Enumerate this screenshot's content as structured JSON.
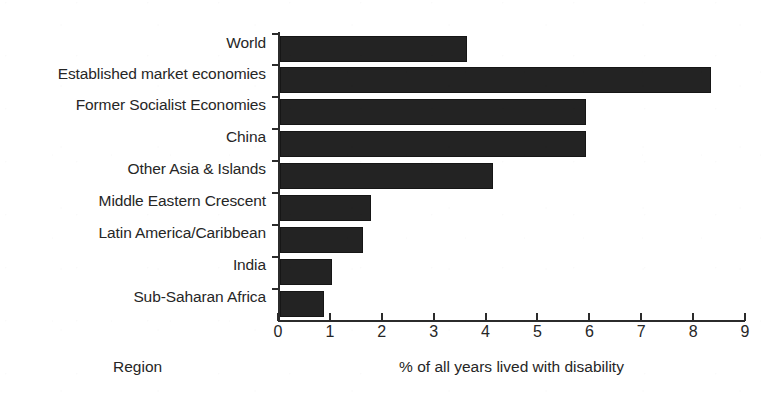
{
  "chart_data": {
    "type": "bar",
    "orientation": "horizontal",
    "title": "",
    "subtitle": "",
    "xlabel": "% of all years lived with disability",
    "ylabel": "Region",
    "categories": [
      "World",
      "Established market economies",
      "Former Socialist Economies",
      "China",
      "Other Asia & Islands",
      "Middle Eastern Crescent",
      "Latin America/Caribbean",
      "India",
      "Sub-Saharan Africa"
    ],
    "values": [
      3.6,
      8.3,
      5.9,
      5.9,
      4.1,
      1.75,
      1.6,
      1.0,
      0.85
    ],
    "xlim": [
      0,
      9
    ],
    "xticks": [
      0,
      1,
      2,
      3,
      4,
      5,
      6,
      7,
      8,
      9
    ],
    "xtick_labels": [
      "0",
      "1",
      "2",
      "3",
      "4",
      "5",
      "6",
      "7",
      "8",
      "9"
    ],
    "grid": false,
    "legend": null,
    "bar_color": "#232323",
    "axis_color": "#2b2b2b",
    "background_color": "#ffffff"
  }
}
